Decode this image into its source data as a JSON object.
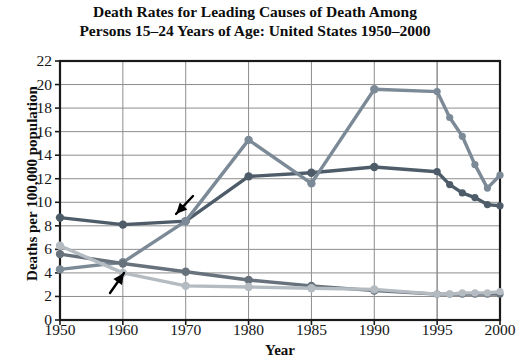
{
  "chart_data": {
    "type": "line",
    "title": "Death Rates for Leading Causes of Death Among Persons 15–24 Years of Age: United States 1950–2000",
    "title_line1": "Death Rates for Leading Causes of Death Among",
    "title_line2": "Persons 15–24 Years of Age: United States 1950–2000",
    "xlabel": "Year",
    "ylabel": "Deaths per 100,000 population",
    "grid": true,
    "legend": "none",
    "ylim": [
      0,
      22
    ],
    "yticks": [
      22,
      20,
      18,
      16,
      14,
      12,
      10,
      8,
      6,
      4,
      2,
      0
    ],
    "categories": [
      "1950",
      "1960",
      "1970",
      "1980",
      "1985",
      "1990",
      "1995",
      "1996",
      "1997",
      "1998",
      "1999",
      "2000"
    ],
    "xticks": [
      "1950",
      "1960",
      "1970",
      "1980",
      "1985",
      "1990",
      "1995",
      "2000"
    ],
    "series": [
      {
        "name": "series-1",
        "color": "#4d5c68",
        "values": [
          8.7,
          8.1,
          8.4,
          12.2,
          12.5,
          13.0,
          12.6,
          11.5,
          10.8,
          10.4,
          9.8,
          9.7
        ]
      },
      {
        "name": "series-2",
        "color": "#7b8a96",
        "values": [
          4.3,
          4.9,
          8.4,
          15.3,
          11.6,
          19.6,
          19.4,
          17.2,
          15.6,
          13.2,
          11.2,
          12.3
        ]
      },
      {
        "name": "series-3",
        "color": "#68727c",
        "values": [
          5.6,
          4.8,
          4.1,
          3.4,
          2.9,
          2.5,
          2.2,
          2.2,
          2.2,
          2.2,
          2.2,
          2.2
        ]
      },
      {
        "name": "series-4",
        "color": "#b4bcc2",
        "values": [
          6.3,
          4.0,
          2.9,
          2.8,
          2.7,
          2.6,
          2.2,
          2.2,
          2.3,
          2.3,
          2.3,
          2.4
        ]
      }
    ],
    "annotations": [
      {
        "name": "arrow-upper",
        "label": "",
        "target_x": 2.0,
        "target_y": 9.2
      },
      {
        "name": "arrow-lower",
        "label": "",
        "target_x": 0.72,
        "target_y": 4.6
      }
    ]
  }
}
